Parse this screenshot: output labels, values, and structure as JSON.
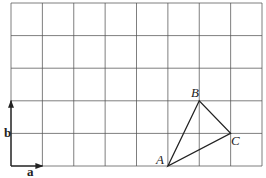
{
  "grid": {
    "origin": [
      11,
      3
    ],
    "cols": 8,
    "rows": 5,
    "cell_w": 31.375,
    "cell_h": 32.6,
    "line_color": "#555555"
  },
  "vectors": [
    {
      "name": "a",
      "label": "a",
      "from": [
        0,
        0
      ],
      "to": [
        1,
        0
      ],
      "label_pos": [
        27,
        176
      ]
    },
    {
      "name": "b",
      "label": "b",
      "from": [
        0,
        0
      ],
      "to": [
        0,
        2
      ],
      "label_pos": [
        4,
        137
      ]
    }
  ],
  "triangle": {
    "points": [
      {
        "name": "A",
        "label": "A",
        "grid": [
          5,
          0
        ],
        "label_pos": [
          156,
          164
        ]
      },
      {
        "name": "B",
        "label": "B",
        "grid": [
          6,
          2
        ],
        "label_pos": [
          191,
          97
        ]
      },
      {
        "name": "C",
        "label": "C",
        "grid": [
          7,
          1
        ],
        "label_pos": [
          231,
          145
        ]
      }
    ]
  }
}
